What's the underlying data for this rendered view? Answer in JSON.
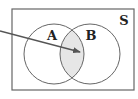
{
  "diagram": {
    "type": "venn",
    "universe": {
      "label": "S",
      "x": 12,
      "y": 9,
      "width": 122,
      "height": 81,
      "label_x": 124,
      "label_y": 25
    },
    "sets": [
      {
        "label": "A",
        "cx": 54,
        "cy": 54,
        "r": 30,
        "label_x": 52,
        "label_y": 40
      },
      {
        "label": "B",
        "cx": 90,
        "cy": 54,
        "r": 30,
        "label_x": 91,
        "label_y": 40
      }
    ],
    "highlight": {
      "region": "A ∩ B",
      "fill": "#e6e6e6"
    },
    "arrow": {
      "x1": 0,
      "y1": 31,
      "x2": 80,
      "y2": 52,
      "points_to": "A ∩ B"
    },
    "colors": {
      "stroke": "#666666",
      "label": "#222222",
      "background": "#ffffff"
    }
  }
}
